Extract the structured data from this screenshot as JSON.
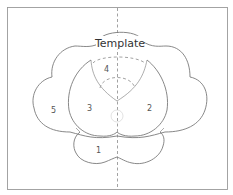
{
  "diagram": {
    "title": "Template",
    "pieces": [
      {
        "id": "1",
        "label": "1"
      },
      {
        "id": "2",
        "label": "2"
      },
      {
        "id": "3",
        "label": "3"
      },
      {
        "id": "4",
        "label": "4"
      },
      {
        "id": "5",
        "label": "5"
      }
    ],
    "colors": {
      "line": "#7a7a7a",
      "background": "#ffffff",
      "text": "#555555"
    }
  }
}
